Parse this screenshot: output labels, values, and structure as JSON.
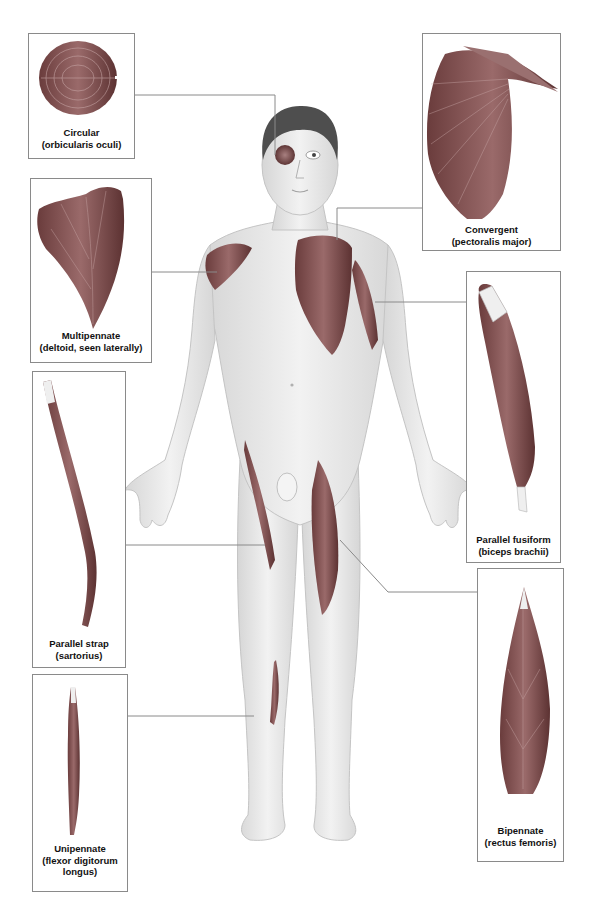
{
  "labels": [
    {
      "id": "circular",
      "name": "Circular",
      "example": "(orbicularis oculi)",
      "region": "eye"
    },
    {
      "id": "convergent",
      "name": "Convergent",
      "example": "(pectoralis major)",
      "region": "chest"
    },
    {
      "id": "multipennate",
      "name": "Multipennate",
      "example": "(deltoid, seen laterally)",
      "region": "shoulder"
    },
    {
      "id": "fusiform",
      "name": "Parallel fusiform",
      "example": "(biceps brachii)",
      "region": "upper arm"
    },
    {
      "id": "strap",
      "name": "Parallel strap",
      "example": "(sartorius)",
      "region": "thigh"
    },
    {
      "id": "unipennate",
      "name": "Unipennate",
      "example_lines": [
        "(flexor digitorum",
        "longus)"
      ],
      "region": "lower leg"
    },
    {
      "id": "bipennate",
      "name": "Bipennate",
      "example": "(rectus femoris)",
      "region": "thigh"
    }
  ],
  "colors": {
    "muscle": "#7a4a4a",
    "muscle_dark": "#5e3535",
    "skin": "#ececec",
    "skin_shade": "#d4d4d4",
    "hair": "#4a4a4a",
    "leader_line": "#8a8a8a",
    "box_border": "#8a8a8a"
  }
}
